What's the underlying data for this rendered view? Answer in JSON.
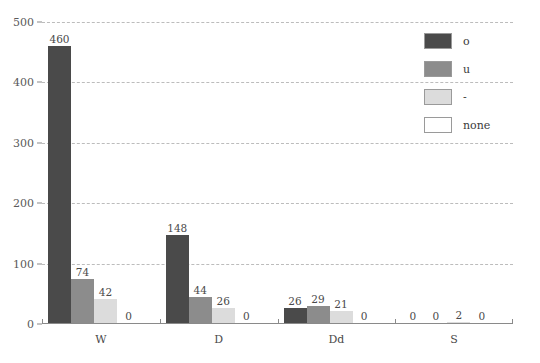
{
  "chart_data": {
    "type": "bar",
    "title": "",
    "subtitle": "",
    "xlabel": "",
    "ylabel": "",
    "categories": [
      "W",
      "D",
      "Dd",
      "S"
    ],
    "series": [
      {
        "name": "o",
        "color": "#4a4a4a",
        "values": [
          460,
          148,
          26,
          0
        ]
      },
      {
        "name": "u",
        "color": "#8c8c8c",
        "values": [
          74,
          44,
          29,
          0
        ]
      },
      {
        "name": "-",
        "color": "#dcdcdc",
        "values": [
          42,
          26,
          21,
          2
        ]
      },
      {
        "name": "none",
        "color": "#ffffff",
        "values": [
          0,
          0,
          0,
          0
        ]
      }
    ],
    "ylim": [
      0,
      500
    ],
    "yticks": [
      0,
      100,
      200,
      300,
      400,
      500
    ],
    "ytick_labels": [
      "0",
      "100",
      "200",
      "300",
      "400",
      "500"
    ],
    "grid": true,
    "grid_style": "dashed",
    "legend_position": "top-right",
    "data_labels": true,
    "bar_labels": [
      [
        "460",
        "74",
        "42",
        "0"
      ],
      [
        "148",
        "44",
        "26",
        "0"
      ],
      [
        "26",
        "29",
        "21",
        "0"
      ],
      [
        "0",
        "0",
        "2",
        "0"
      ]
    ]
  },
  "legend": {
    "items": [
      {
        "label": "o",
        "color": "#4a4a4a"
      },
      {
        "label": "u",
        "color": "#8c8c8c"
      },
      {
        "label": "-",
        "color": "#dcdcdc"
      },
      {
        "label": "none",
        "color": "#ffffff"
      }
    ]
  },
  "axes": {
    "y_tick_labels": [
      "500",
      "400",
      "300",
      "200",
      "100",
      "0"
    ],
    "x_group_labels": [
      "W",
      "D",
      "Dd",
      "S"
    ]
  },
  "colors": {
    "grid": "#bcbcbc",
    "axis": "#8a8a8a",
    "text": "#4a4a4a",
    "background": "#ffffff"
  }
}
